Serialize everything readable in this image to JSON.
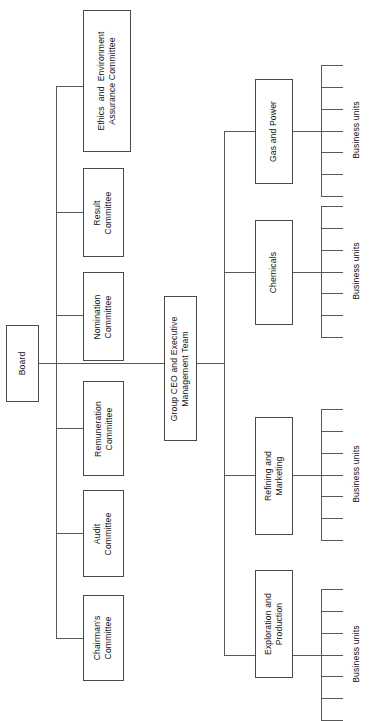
{
  "diagram": {
    "type": "organizational-chart",
    "orientation": "rotated-90-ccw",
    "root": {
      "label": "Board"
    },
    "executive": {
      "label": "Group CEO and Executive\nManagement Team"
    },
    "committees": [
      {
        "label": "Chairman's\nCommittee"
      },
      {
        "label": "Audit\nCommittee"
      },
      {
        "label": "Remuneration\nCommittee"
      },
      {
        "label": "Nomination\nCommittee"
      },
      {
        "label": "Result\nCommittee"
      },
      {
        "label": "Ethics  and  Environment\nAssurance Committee"
      }
    ],
    "divisions": [
      {
        "label": "Exploration and\nProduction",
        "units_label": "Business units",
        "unit_count": 7
      },
      {
        "label": "Refining and\nMarketing",
        "units_label": "Business units",
        "unit_count": 7
      },
      {
        "label": "Chemicals",
        "units_label": "Business units",
        "unit_count": 7
      },
      {
        "label": "Gas and Power",
        "units_label": "Business units",
        "unit_count": 7
      }
    ],
    "colors": {
      "line": "#58585a",
      "box_border": "#4a4a4a",
      "text": "#141414",
      "background": "#ffffff"
    }
  }
}
